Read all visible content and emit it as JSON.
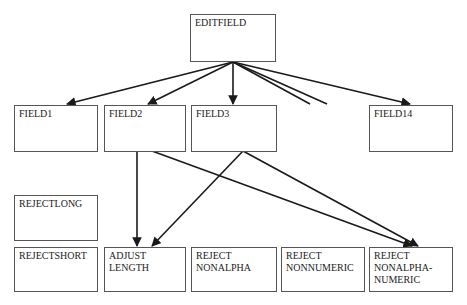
{
  "diagram": {
    "type": "structure-chart",
    "nodes": [
      {
        "id": "editfield",
        "label": "EDITFIELD"
      },
      {
        "id": "field1",
        "label": "FIELD1"
      },
      {
        "id": "field2",
        "label": "FIELD2"
      },
      {
        "id": "field3",
        "label": "FIELD3"
      },
      {
        "id": "field14",
        "label": "FIELD14"
      },
      {
        "id": "rejectlong",
        "label": "REJECTLONG"
      },
      {
        "id": "rejectshort",
        "label": "REJECTSHORT"
      },
      {
        "id": "adjustlength",
        "label": "ADJUST\nLENGTH"
      },
      {
        "id": "rejectnonalpha",
        "label": "REJECT\nNONALPHA"
      },
      {
        "id": "rejectnonnumeric",
        "label": "REJECT\nNONNUMERIC"
      },
      {
        "id": "rejectnonalphanumeric",
        "label": "REJECT\nNONALPHA-\nNUMERIC"
      }
    ],
    "edges": [
      {
        "from": "editfield",
        "to": "field1"
      },
      {
        "from": "editfield",
        "to": "field2"
      },
      {
        "from": "editfield",
        "to": "field3"
      },
      {
        "from": "editfield",
        "to": "field14"
      },
      {
        "from": "editfield",
        "to": "elided",
        "note": "two unlabeled lines indicating omitted fields"
      },
      {
        "from": "field2",
        "to": "adjustlength"
      },
      {
        "from": "field2",
        "to": "rejectnonalphanumeric"
      },
      {
        "from": "field3",
        "to": "adjustlength"
      },
      {
        "from": "field3",
        "to": "rejectnonalphanumeric"
      }
    ],
    "line_color": "#1a1a1a",
    "box_border_color": "#555555"
  }
}
